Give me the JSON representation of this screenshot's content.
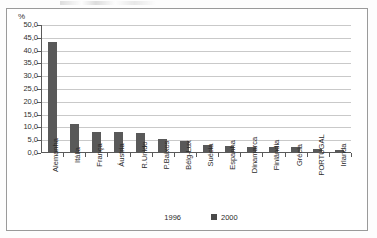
{
  "chart_data": {
    "type": "bar",
    "title": "",
    "xlabel": "",
    "ylabel": "%",
    "ylim": [
      0,
      50
    ],
    "ytick_step": 5,
    "grid": true,
    "legend_position": "bottom",
    "decimal_separator": ",",
    "categories": [
      "Alemanha",
      "Itália",
      "França",
      "Áustria",
      "R.Unido",
      "P.Baixos",
      "Bélg-Lux",
      "Suécia",
      "Espanha",
      "Dinamarca",
      "Finlândia",
      "Grécia",
      "PORTUGAL",
      "Irlanda"
    ],
    "ytick_labels": [
      "0,0",
      "5,0",
      "10,0",
      "15,0",
      "20,0",
      "25,0",
      "30,0",
      "35,0",
      "40,0",
      "45,0",
      "50,0"
    ],
    "series": [
      {
        "name": "1996",
        "swatch": "empty",
        "values": [
          null,
          null,
          null,
          null,
          null,
          null,
          null,
          null,
          null,
          null,
          null,
          null,
          null,
          null
        ]
      },
      {
        "name": "2000",
        "swatch": "filled",
        "color": "#595959",
        "values": [
          43.3,
          11.4,
          8.4,
          8.2,
          7.9,
          5.6,
          4.6,
          3.1,
          2.9,
          2.3,
          2.3,
          2.2,
          1.4,
          1.3
        ]
      }
    ]
  },
  "legend": {
    "items": [
      {
        "label": "1996"
      },
      {
        "label": "2000"
      }
    ]
  }
}
